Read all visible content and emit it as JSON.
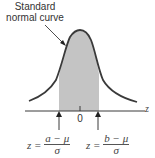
{
  "annotation": {
    "line1": "Standard",
    "line2": "normal curve"
  },
  "axis": {
    "label": "z",
    "zero_label": "0"
  },
  "left_bound": {
    "lhs": "z =",
    "numerator": "a − μ",
    "denominator": "σ"
  },
  "right_bound": {
    "lhs": "z =",
    "numerator": "b − μ",
    "denominator": "σ"
  },
  "colors": {
    "curve": "#3a3a3a",
    "shade": "#c4c4c4",
    "axis": "#3a3a3a"
  }
}
